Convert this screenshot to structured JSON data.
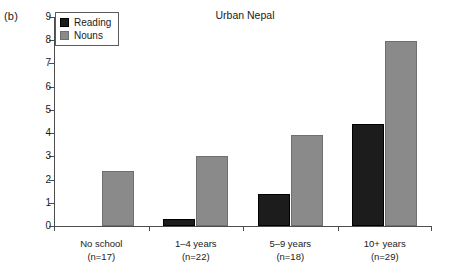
{
  "panel_label": "(b)",
  "chart_data": {
    "type": "bar",
    "title": "Urban Nepal",
    "xlabel": "",
    "ylabel": "",
    "ylim": [
      0,
      9
    ],
    "yticks": [
      "0",
      "1",
      "2",
      "3",
      "4",
      "5",
      "6",
      "7",
      "8",
      "9"
    ],
    "grid": false,
    "legend_position": "upper left inside plot",
    "categories": [
      "No school\n(n=17)",
      "1–4 years\n(n=22)",
      "5–9 years\n(n=18)",
      "10+ years\n(n=29)"
    ],
    "category_lines": [
      {
        "name": "No school",
        "n": "(n=17)"
      },
      {
        "name": "1–4 years",
        "n": "(n=22)"
      },
      {
        "name": "5–9 years",
        "n": "(n=18)"
      },
      {
        "name": "10+ years",
        "n": "(n=29)"
      }
    ],
    "series": [
      {
        "name": "Reading",
        "color": "#1c1c1c",
        "values": [
          0,
          0.3,
          1.4,
          4.4
        ]
      },
      {
        "name": "Nouns",
        "color": "#8a8a8a",
        "values": [
          2.35,
          3.0,
          3.9,
          7.95
        ]
      }
    ]
  },
  "legend": {
    "items": [
      {
        "label": "Reading",
        "color": "#1c1c1c"
      },
      {
        "label": "Nouns",
        "color": "#8a8a8a"
      }
    ]
  }
}
